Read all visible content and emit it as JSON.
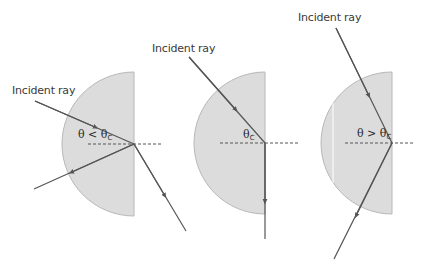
{
  "colors": {
    "block_fill": "#dcdcdc",
    "block_stroke": "#b8b8b8",
    "ray": "#555555",
    "normal": "#555555",
    "text": "#3a3a3a"
  },
  "panels": [
    {
      "id": "below-critical",
      "incident_label": "Incident ray",
      "angle_symbol": "θ",
      "angle_relation": " < ",
      "angle_ref": "θ",
      "angle_ref_sub": "C",
      "outcome": "partial reflection and refraction out of block"
    },
    {
      "id": "at-critical",
      "incident_label": "Incident ray",
      "angle_symbol": "",
      "angle_relation": "",
      "angle_ref": "θ",
      "angle_ref_sub": "C",
      "outcome": "refracted ray travels along the surface"
    },
    {
      "id": "above-critical",
      "incident_label": "Incident ray",
      "angle_symbol": "θ",
      "angle_relation": " > ",
      "angle_ref": "θ",
      "angle_ref_sub": "C",
      "outcome": "total internal reflection"
    }
  ]
}
